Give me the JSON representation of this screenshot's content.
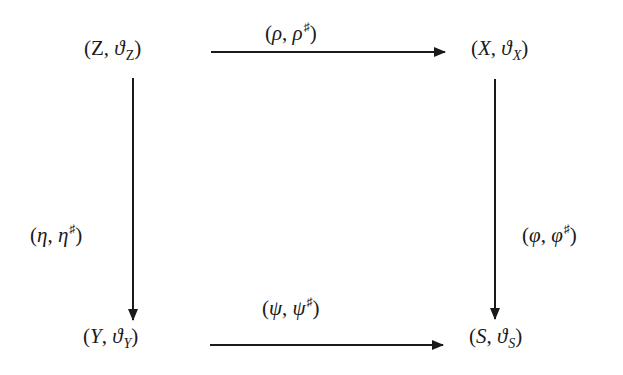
{
  "diagram": {
    "type": "commutative-square",
    "nodes": {
      "top_left": {
        "base": "Z",
        "sheaf": "ϑ",
        "sub": "Z",
        "open": "(",
        "sep": ", ",
        "close": ")"
      },
      "top_right": {
        "base": "X",
        "sheaf": "ϑ",
        "sub": "X",
        "open": "(",
        "sep": ", ",
        "close": ")"
      },
      "bottom_left": {
        "base": "Y",
        "sheaf": "ϑ",
        "sub": "Y",
        "open": "(",
        "sep": ", ",
        "close": ")"
      },
      "bottom_right": {
        "base": "S",
        "sheaf": "ϑ",
        "sub": "S",
        "open": "(",
        "sep": ", ",
        "close": ")"
      }
    },
    "arrows": {
      "top": {
        "from": "(Z, ϑ_Z)",
        "to": "(X, ϑ_X)",
        "map": "ρ",
        "sharp": "♯",
        "open": "(",
        "sep": ", ",
        "close": ")"
      },
      "left": {
        "from": "(Z, ϑ_Z)",
        "to": "(Y, ϑ_Y)",
        "map": "η",
        "sharp": "♯",
        "open": "(",
        "sep": ", ",
        "close": ")"
      },
      "right": {
        "from": "(X, ϑ_X)",
        "to": "(S, ϑ_S)",
        "map": "φ",
        "sharp": "♯",
        "open": "(",
        "sep": ", ",
        "close": ")"
      },
      "bottom": {
        "from": "(Y, ϑ_Y)",
        "to": "(S, ϑ_S)",
        "map": "ψ",
        "sharp": "♯",
        "open": "(",
        "sep": ", ",
        "close": ")"
      }
    },
    "colors": {
      "ink": "#1a1a1a",
      "background": "#ffffff"
    }
  }
}
